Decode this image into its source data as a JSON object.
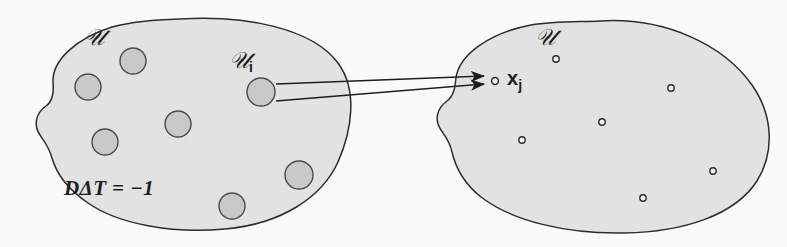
{
  "figure": {
    "type": "set-mapping-diagram",
    "background_color": "#fbfbfb",
    "blob_fill": "#e3e3e3",
    "blob_stroke": "#2a2a2a",
    "circle_fill": "#c9c9c9",
    "circle_stroke": "#4a4a4a",
    "dot_fill": "#f0f0f0",
    "dot_stroke": "#2a2a2a",
    "arrow_color": "#1b1b1b",
    "text_color": "#1b1b1b"
  },
  "left_region": {
    "label": "U",
    "label_display": "𝒰",
    "member_label": "𝒰",
    "member_subscript": "i",
    "formula": "DΔT = −1",
    "formula_parts": {
      "d": "D",
      "delta": "Δ",
      "t": "T",
      "equals": "=",
      "value": "−1"
    },
    "circle_count": 7,
    "circles": [
      {
        "name": "circle-1",
        "cx": 133,
        "cy": 61,
        "r": 13
      },
      {
        "name": "circle-2",
        "cx": 88,
        "cy": 87,
        "r": 13
      },
      {
        "name": "circle-Ui",
        "cx": 261,
        "cy": 92,
        "r": 14,
        "labeled": true
      },
      {
        "name": "circle-4",
        "cx": 178,
        "cy": 124,
        "r": 13
      },
      {
        "name": "circle-5",
        "cx": 105,
        "cy": 142,
        "r": 13
      },
      {
        "name": "circle-6",
        "cx": 299,
        "cy": 175,
        "r": 14
      },
      {
        "name": "circle-7",
        "cx": 232,
        "cy": 206,
        "r": 13
      }
    ]
  },
  "right_region": {
    "label": "U",
    "label_display": "𝒰",
    "point_label_base": "x",
    "point_label_subscript": "j",
    "point_label": "xⱼ",
    "dot_count": 7,
    "dots": [
      {
        "name": "dot-xj",
        "cx": 495,
        "cy": 81,
        "r": 3.4,
        "labeled": true
      },
      {
        "name": "dot-2",
        "cx": 556,
        "cy": 59,
        "r": 3.2
      },
      {
        "name": "dot-3",
        "cx": 671,
        "cy": 88,
        "r": 3.2
      },
      {
        "name": "dot-4",
        "cx": 602,
        "cy": 122,
        "r": 3.2
      },
      {
        "name": "dot-5",
        "cx": 522,
        "cy": 140,
        "r": 3.2
      },
      {
        "name": "dot-6",
        "cx": 713,
        "cy": 171,
        "r": 3.2
      },
      {
        "name": "dot-7",
        "cx": 643,
        "cy": 198,
        "r": 3.2
      }
    ]
  },
  "arrows": [
    {
      "name": "arrow-upper",
      "from_x": 275,
      "from_y": 84,
      "to_x": 487,
      "to_y": 76
    },
    {
      "name": "arrow-lower",
      "from_x": 275,
      "from_y": 100,
      "to_x": 487,
      "to_y": 83
    }
  ],
  "labels": {
    "left_set": {
      "text": "𝒰",
      "x": 86,
      "y": 30
    },
    "left_member": {
      "text": "𝒰",
      "sub": "i",
      "x": 231,
      "y": 52
    },
    "left_formula": {
      "text": "DΔT = −1",
      "x": 66,
      "y": 180
    },
    "right_set": {
      "text": "𝒰",
      "x": 537,
      "y": 30
    },
    "right_point": {
      "text": "x",
      "sub": "j",
      "x": 509,
      "y": 71
    }
  }
}
